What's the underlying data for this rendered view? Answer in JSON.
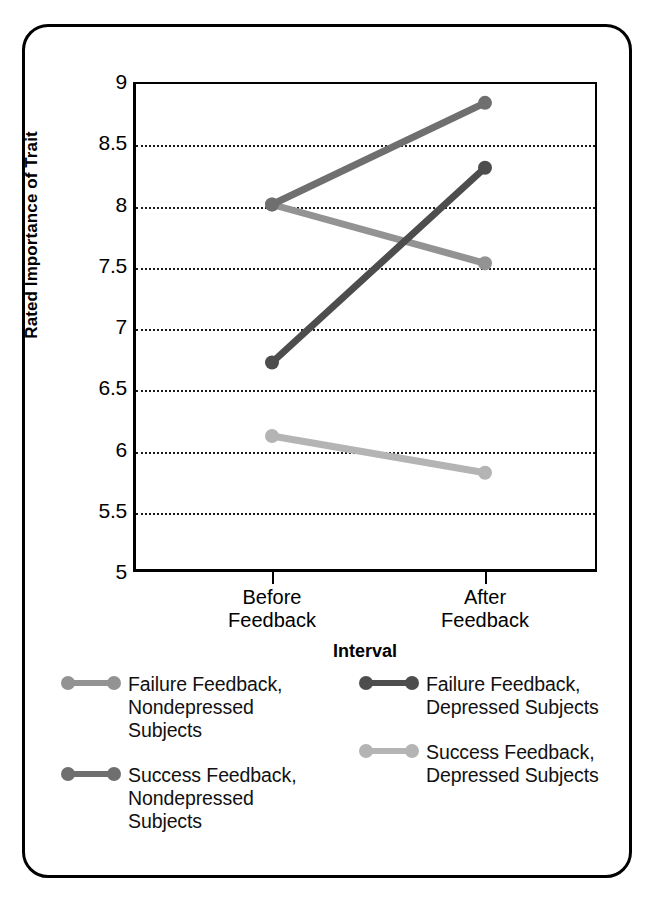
{
  "chart_data": {
    "type": "line",
    "title": "",
    "xlabel": "Interval",
    "ylabel": "Rated Importance of Trait",
    "categories": [
      "Before\nFeedback",
      "After\nFeedback"
    ],
    "category_labels": [
      {
        "line1": "Before",
        "line2": "Feedback"
      },
      {
        "line1": "After",
        "line2": "Feedback"
      }
    ],
    "ylim": [
      5,
      9
    ],
    "yticks": [
      9,
      8.5,
      8,
      7.5,
      7,
      6.5,
      6,
      5.5,
      5
    ],
    "ytick_labels": [
      "9",
      "8.5",
      "8",
      "7.5",
      "7",
      "6.5",
      "6",
      "5.5",
      "5"
    ],
    "grid": true,
    "grid_style": "dotted",
    "legend_position": "below-plot",
    "series": [
      {
        "name": "Failure Feedback, Nondepressed Subjects",
        "label_lines": [
          "Failure Feedback,",
          "Nondepressed",
          "Subjects"
        ],
        "values": [
          8.0,
          7.52
        ],
        "color": "#939393",
        "marker": "circle"
      },
      {
        "name": "Failure Feedback, Depressed Subjects",
        "label_lines": [
          "Failure Feedback,",
          "Depressed Subjects"
        ],
        "values": [
          6.71,
          8.3
        ],
        "color": "#4d4d4d",
        "marker": "circle"
      },
      {
        "name": "Success Feedback, Nondepressed Subjects",
        "label_lines": [
          "Success Feedback,",
          "Nondepressed",
          "Subjects"
        ],
        "values": [
          8.0,
          8.83
        ],
        "color": "#6f6f6f",
        "marker": "circle"
      },
      {
        "name": "Success Feedback, Depressed Subjects",
        "label_lines": [
          "Success Feedback,",
          "Depressed Subjects"
        ],
        "values": [
          6.11,
          5.81
        ],
        "color": "#b4b4b4",
        "marker": "circle"
      }
    ]
  },
  "axis": {
    "y_title": "Rated Importance of Trait",
    "x_title": "Interval"
  },
  "colors": {
    "axis": "#000000",
    "grid": "#1a1a1a",
    "background": "#ffffff",
    "frame": "#000000"
  }
}
